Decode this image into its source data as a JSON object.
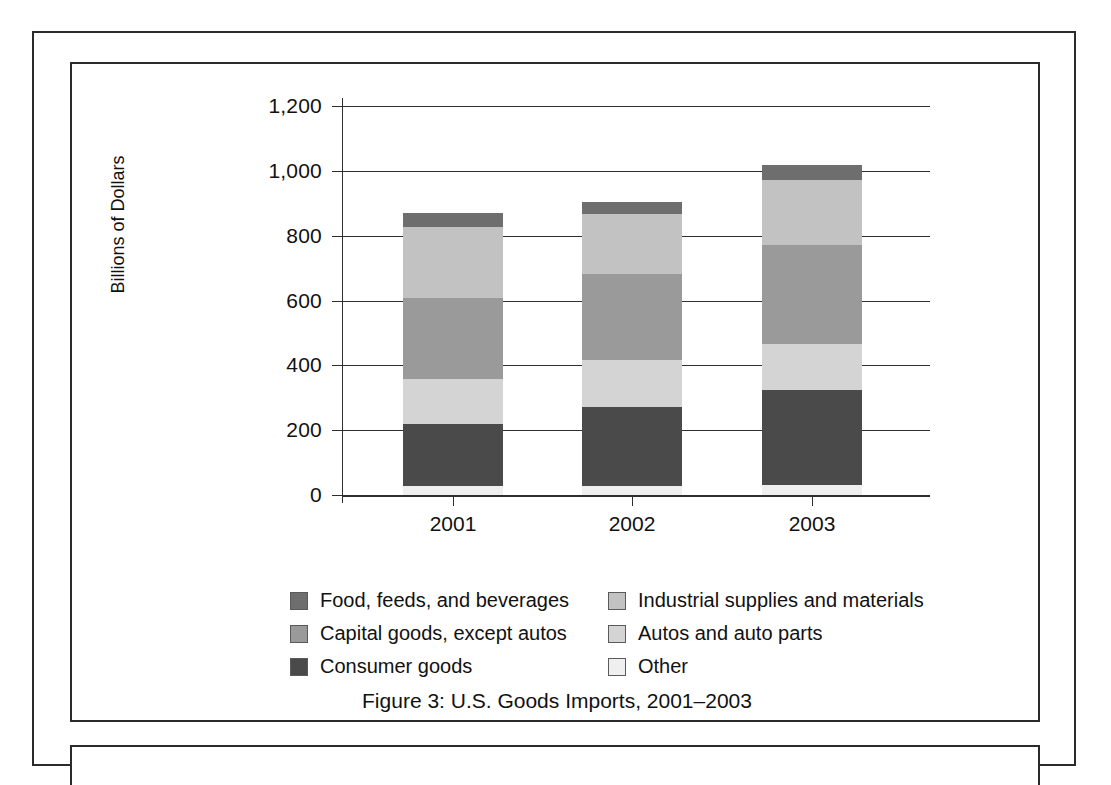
{
  "figure": {
    "caption": "Figure 3:  U.S. Goods Imports, 2001–2003"
  },
  "chart_data": {
    "type": "bar",
    "subtype": "stacked",
    "title": "Figure 3:  U.S. Goods Imports, 2001–2003",
    "xlabel": "",
    "ylabel": "Billions of Dollars",
    "categories": [
      "2001",
      "2002",
      "2003"
    ],
    "ylim": [
      0,
      1200
    ],
    "yticks": [
      0,
      200,
      400,
      600,
      800,
      1000,
      1200
    ],
    "ytick_labels": [
      "0",
      "200",
      "400",
      "600",
      "800",
      "1,000",
      "1,200"
    ],
    "grid": true,
    "legend_position": "below-plot",
    "series": [
      {
        "name": "Other",
        "color": "#efefef",
        "values": [
          28,
          28,
          31
        ]
      },
      {
        "name": "Consumer goods",
        "color": "#4a4a4a",
        "values": [
          191,
          243,
          293
        ]
      },
      {
        "name": "Autos and auto parts",
        "color": "#d4d4d4",
        "values": [
          139,
          145,
          142
        ]
      },
      {
        "name": "Capital goods, except autos",
        "color": "#9a9a9a",
        "values": [
          250,
          266,
          305
        ]
      },
      {
        "name": "Industrial supplies and materials",
        "color": "#c2c2c2",
        "values": [
          219,
          185,
          201
        ]
      },
      {
        "name": "Food, feeds, and beverages",
        "color": "#6e6e6e",
        "values": [
          43,
          37,
          46
        ]
      }
    ],
    "totals": [
      870,
      904,
      1018
    ]
  },
  "legend": {
    "left_column": [
      {
        "label": "Food, feeds, and beverages",
        "color": "#6e6e6e"
      },
      {
        "label": "Capital goods, except autos",
        "color": "#9a9a9a"
      },
      {
        "label": "Consumer goods",
        "color": "#4a4a4a"
      }
    ],
    "right_column": [
      {
        "label": "Industrial supplies and materials",
        "color": "#c2c2c2"
      },
      {
        "label": "Autos and auto parts",
        "color": "#d4d4d4"
      },
      {
        "label": "Other",
        "color": "#efefef"
      }
    ]
  }
}
